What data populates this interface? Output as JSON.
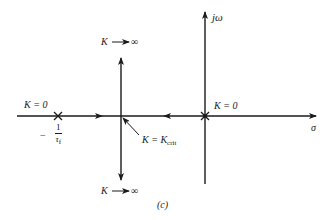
{
  "diagram": {
    "type": "root-locus",
    "caption": "(c)",
    "axes": {
      "real_axis_label": "σ",
      "imag_axis_label": "jω"
    },
    "points": {
      "pole_left": {
        "gain_label": "K = 0",
        "location_prefix": "−",
        "location_numerator": "1",
        "location_denominator": "τ",
        "location_denominator_sub": "f"
      },
      "pole_origin": {
        "gain_label": "K = 0"
      },
      "breakaway": {
        "gain_prefix": "K = K",
        "gain_sub": "crit"
      }
    },
    "asymptotes": {
      "upper": {
        "k": "K",
        "arrow": "→",
        "inf": "∞"
      },
      "lower": {
        "k": "K",
        "arrow": "→",
        "inf": "∞"
      }
    },
    "colors": {
      "line": "#1a1a1a",
      "background": "#ffffff"
    }
  }
}
